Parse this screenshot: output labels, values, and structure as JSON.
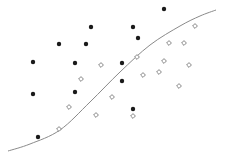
{
  "chart_data": {
    "type": "scatter",
    "title": "",
    "xlabel": "",
    "ylabel": "",
    "grid": false,
    "legend": null,
    "canvas": {
      "width": 226,
      "height": 163
    },
    "boundary": {
      "name": "decision-boundary",
      "color": "#8a8a8a",
      "points": [
        [
          8,
          151
        ],
        [
          30,
          144
        ],
        [
          60,
          130
        ],
        [
          90,
          102
        ],
        [
          120,
          72
        ],
        [
          150,
          45
        ],
        [
          180,
          26
        ],
        [
          200,
          16
        ],
        [
          216,
          10
        ]
      ]
    },
    "series": [
      {
        "name": "class-filled",
        "marker": "filled-circle",
        "color": "#1a1a1a",
        "points": [
          [
            164,
            9
          ],
          [
            91,
            27
          ],
          [
            133,
            27
          ],
          [
            59,
            44
          ],
          [
            86,
            44
          ],
          [
            138,
            38
          ],
          [
            33,
            62
          ],
          [
            75,
            63
          ],
          [
            122,
            63
          ],
          [
            122,
            81
          ],
          [
            33,
            94
          ],
          [
            75,
            92
          ],
          [
            133,
            109
          ],
          [
            38,
            137
          ]
        ]
      },
      {
        "name": "class-hollow",
        "marker": "hollow-diamond",
        "color": "#777777",
        "points": [
          [
            195,
            26
          ],
          [
            169,
            43
          ],
          [
            184,
            43
          ],
          [
            137,
            57
          ],
          [
            164,
            61
          ],
          [
            101,
            65
          ],
          [
            189,
            65
          ],
          [
            159,
            72
          ],
          [
            143,
            75
          ],
          [
            81,
            79
          ],
          [
            179,
            86
          ],
          [
            112,
            97
          ],
          [
            69,
            107
          ],
          [
            96,
            115
          ],
          [
            133,
            116
          ],
          [
            59,
            129
          ]
        ]
      }
    ]
  }
}
